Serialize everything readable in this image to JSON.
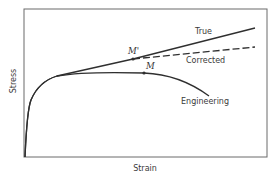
{
  "chart_data": {
    "type": "line",
    "title": "",
    "xlabel": "Strain",
    "ylabel": "Stress",
    "grid": false,
    "axes_ticks": false,
    "frame": {
      "x0": 24,
      "y0": 9,
      "x1": 267,
      "y1": 157
    },
    "series": [
      {
        "name": "True",
        "style": "solid",
        "path": "M25,157 C26,135 27,110 31,100 C36,88 44,80 57,76 L133,59 L255,28",
        "label_pos": [
          195,
          34
        ]
      },
      {
        "name": "Corrected",
        "style": "dashed",
        "path": "M133,59 L255,47",
        "label_pos": [
          186,
          63
        ]
      },
      {
        "name": "Engineering",
        "style": "solid",
        "path": "M25,157 C26,135 27,110 31,100 C36,88 44,80 57,76 C80,72 110,72 144,73 C170,74 190,82 209,96",
        "label_pos": [
          181,
          104
        ]
      }
    ],
    "points": [
      {
        "name": "M'",
        "x": 133,
        "y": 59,
        "label_pos": [
          128,
          54
        ]
      },
      {
        "name": "M",
        "x": 144,
        "y": 73,
        "label_pos": [
          146,
          69
        ]
      }
    ],
    "colors": {
      "line": "#2f2f2f",
      "frame": "#6a6a6a",
      "text": "#3a3a3a"
    }
  }
}
